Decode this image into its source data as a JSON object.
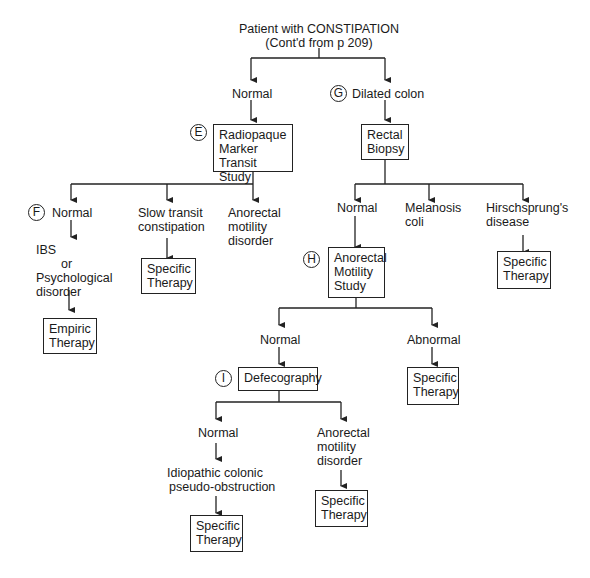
{
  "title": {
    "line1": "Patient with CONSTIPATION",
    "line2": "(Cont'd from p 209)"
  },
  "nodes": {
    "normal_top": "Normal",
    "dilated_colon": "Dilated colon",
    "radiopaque": {
      "l1": "Radiopaque",
      "l2": "Marker",
      "l3": "Transit Study"
    },
    "rectal_biopsy": {
      "l1": "Rectal",
      "l2": "Biopsy"
    },
    "f_normal": "Normal",
    "slow_transit": {
      "l1": "Slow transit",
      "l2": "constipation"
    },
    "anorectal_motility_disorder_1": {
      "l1": "Anorectal",
      "l2": "motility",
      "l3": "disorder"
    },
    "ibs": {
      "l1": "IBS",
      "l2": "or",
      "l3": "Psychological",
      "l4": "disorder"
    },
    "empiric_therapy": {
      "l1": "Empiric",
      "l2": "Therapy"
    },
    "specific_therapy_slow": {
      "l1": "Specific",
      "l2": "Therapy"
    },
    "biopsy_normal": "Normal",
    "melanosis": {
      "l1": "Melanosis",
      "l2": "coli"
    },
    "hirschsprung": {
      "l1": "Hirschsprung's",
      "l2": "disease"
    },
    "specific_therapy_hirsch": {
      "l1": "Specific",
      "l2": "Therapy"
    },
    "anorectal_study": {
      "l1": "Anorectal",
      "l2": "Motility",
      "l3": "Study"
    },
    "h_normal": "Normal",
    "h_abnormal": "Abnormal",
    "defecography": "Defecography",
    "specific_therapy_abnormal": {
      "l1": "Specific",
      "l2": "Therapy"
    },
    "i_normal": "Normal",
    "anorectal_motility_disorder_2": {
      "l1": "Anorectal",
      "l2": "motility",
      "l3": "disorder"
    },
    "idiopathic": {
      "l1": "Idiopathic colonic",
      "l2": "pseudo-obstruction"
    },
    "specific_therapy_idiopathic": {
      "l1": "Specific",
      "l2": "Therapy"
    },
    "specific_therapy_anorectal": {
      "l1": "Specific",
      "l2": "Therapy"
    }
  },
  "markers": {
    "e": "E",
    "f": "F",
    "g": "G",
    "h": "H",
    "i": "I"
  },
  "colors": {
    "line": "#222222",
    "text": "#1a1a1a",
    "background": "#ffffff"
  }
}
